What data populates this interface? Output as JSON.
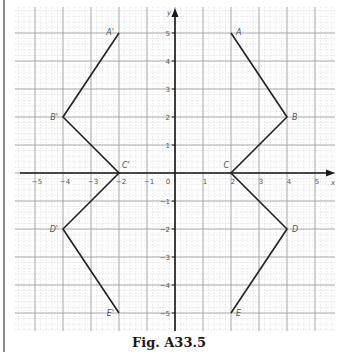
{
  "figure": {
    "caption": "Fig. A33.5",
    "axes": {
      "x_label": "x",
      "y_label": "y",
      "x_range": [
        -5.5,
        5.5
      ],
      "y_range": [
        -6,
        6
      ],
      "x_ticks": [
        -5,
        -4,
        -3,
        -2,
        -1,
        0,
        1,
        2,
        3,
        4,
        5
      ],
      "y_ticks": [
        -5,
        -4,
        -3,
        -2,
        -1,
        1,
        2,
        3,
        4,
        5
      ],
      "origin_label": "0"
    },
    "shapes": [
      {
        "name": "original",
        "points": [
          {
            "label": "A",
            "x": 2,
            "y": 5
          },
          {
            "label": "B",
            "x": 4,
            "y": 2
          },
          {
            "label": "C",
            "x": 2,
            "y": 0
          },
          {
            "label": "D",
            "x": 4,
            "y": -2
          },
          {
            "label": "E",
            "x": 2,
            "y": -5
          }
        ]
      },
      {
        "name": "reflection",
        "points": [
          {
            "label": "A'",
            "x": -2,
            "y": 5
          },
          {
            "label": "B'",
            "x": -4,
            "y": 2
          },
          {
            "label": "C'",
            "x": -2,
            "y": 0
          },
          {
            "label": "D'",
            "x": -4,
            "y": -2
          },
          {
            "label": "E'",
            "x": -2,
            "y": -5
          }
        ]
      }
    ],
    "colors": {
      "major_grid": "#9a9a9a",
      "minor_grid": "#cfcfcf",
      "axis": "#1a1a1a",
      "line": "#222222",
      "label": "#555555"
    }
  }
}
